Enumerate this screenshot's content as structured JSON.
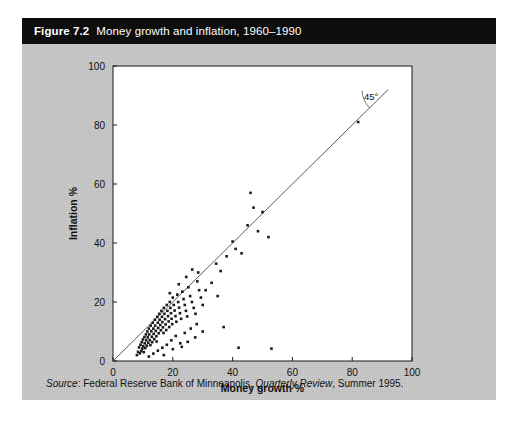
{
  "figure": {
    "number": "Figure 7.2",
    "title": "Money growth and inflation, 1960–1990",
    "source_label": "Source",
    "source_sep": ": ",
    "source_org": "Federal Reserve Bank of Minneapolis, ",
    "source_journal": "Quarterly Review",
    "source_tail": ", Summer 1995."
  },
  "colors": {
    "title_bar": "#0d0d0d",
    "title_text": "#ffffff",
    "panel": "#c9c9c9",
    "plot_bg": "#ffffff",
    "axis": "#1a1a1a",
    "point": "#1a1a1a",
    "line": "#4a4a4a",
    "page": "#ffffff"
  },
  "annotations": {
    "angle_label": "45°"
  },
  "chart_data": {
    "type": "scatter",
    "title": "Money growth and inflation, 1960–1990",
    "xlabel": "Money growth %",
    "ylabel": "Inflation %",
    "xlim": [
      0,
      100
    ],
    "ylim": [
      0,
      100
    ],
    "xticks": [
      0,
      20,
      40,
      60,
      80,
      100
    ],
    "yticks": [
      0,
      20,
      40,
      60,
      80,
      100
    ],
    "xticklabels": [
      "0",
      "20",
      "40",
      "60",
      "80",
      "100"
    ],
    "yticklabels": [
      "0",
      "20",
      "40",
      "60",
      "80",
      "100"
    ],
    "grid": false,
    "legend": false,
    "reference_line": {
      "label": "45°",
      "slope": 1,
      "intercept": 0,
      "from": [
        0,
        0
      ],
      "to": [
        92,
        92
      ]
    },
    "series": [
      {
        "name": "Countries",
        "marker": "square",
        "points": [
          [
            8.0,
            2.0
          ],
          [
            8.4,
            3.1
          ],
          [
            8.7,
            4.6
          ],
          [
            9.0,
            2.6
          ],
          [
            9.2,
            5.5
          ],
          [
            9.5,
            3.4
          ],
          [
            9.6,
            6.4
          ],
          [
            9.8,
            4.2
          ],
          [
            10.0,
            7.3
          ],
          [
            10.1,
            5.0
          ],
          [
            10.3,
            3.0
          ],
          [
            10.5,
            8.1
          ],
          [
            10.6,
            6.0
          ],
          [
            10.8,
            4.4
          ],
          [
            11.0,
            9.0
          ],
          [
            11.1,
            7.0
          ],
          [
            11.3,
            5.2
          ],
          [
            11.5,
            10.0
          ],
          [
            11.6,
            8.0
          ],
          [
            11.8,
            6.2
          ],
          [
            12.0,
            11.0
          ],
          [
            12.1,
            9.0
          ],
          [
            12.3,
            7.1
          ],
          [
            12.5,
            5.4
          ],
          [
            12.6,
            12.0
          ],
          [
            12.8,
            10.1
          ],
          [
            13.0,
            8.2
          ],
          [
            13.1,
            6.4
          ],
          [
            13.3,
            13.0
          ],
          [
            13.5,
            11.0
          ],
          [
            13.6,
            9.2
          ],
          [
            13.8,
            7.4
          ],
          [
            14.0,
            14.0
          ],
          [
            14.1,
            12.0
          ],
          [
            14.3,
            10.2
          ],
          [
            14.5,
            8.4
          ],
          [
            14.6,
            6.6
          ],
          [
            14.8,
            15.0
          ],
          [
            15.0,
            13.0
          ],
          [
            15.1,
            11.2
          ],
          [
            15.3,
            9.4
          ],
          [
            15.5,
            16.0
          ],
          [
            15.6,
            14.0
          ],
          [
            15.8,
            12.2
          ],
          [
            16.0,
            10.4
          ],
          [
            16.2,
            17.0
          ],
          [
            16.4,
            15.0
          ],
          [
            16.5,
            13.2
          ],
          [
            16.7,
            11.4
          ],
          [
            16.9,
            9.5
          ],
          [
            17.0,
            18.0
          ],
          [
            17.2,
            16.0
          ],
          [
            17.4,
            14.2
          ],
          [
            17.6,
            12.4
          ],
          [
            17.8,
            10.5
          ],
          [
            18.0,
            19.0
          ],
          [
            18.2,
            17.0
          ],
          [
            18.4,
            15.2
          ],
          [
            18.6,
            13.4
          ],
          [
            18.8,
            11.5
          ],
          [
            19.0,
            20.0
          ],
          [
            19.2,
            18.0
          ],
          [
            19.4,
            16.2
          ],
          [
            19.6,
            14.3
          ],
          [
            19.8,
            12.5
          ],
          [
            20.0,
            21.5
          ],
          [
            20.3,
            19.0
          ],
          [
            20.6,
            17.1
          ],
          [
            20.9,
            15.2
          ],
          [
            21.2,
            13.3
          ],
          [
            21.5,
            22.5
          ],
          [
            21.8,
            20.0
          ],
          [
            22.1,
            18.1
          ],
          [
            22.4,
            16.2
          ],
          [
            22.8,
            14.3
          ],
          [
            23.2,
            23.5
          ],
          [
            23.6,
            21.0
          ],
          [
            24.0,
            19.0
          ],
          [
            24.4,
            17.0
          ],
          [
            24.8,
            15.1
          ],
          [
            25.2,
            25.0
          ],
          [
            25.8,
            22.0
          ],
          [
            26.4,
            20.0
          ],
          [
            27.0,
            18.0
          ],
          [
            27.6,
            16.0
          ],
          [
            28.2,
            27.0
          ],
          [
            28.8,
            24.0
          ],
          [
            29.4,
            21.5
          ],
          [
            30.0,
            19.0
          ],
          [
            12.0,
            1.5
          ],
          [
            13.5,
            2.5
          ],
          [
            15.0,
            3.5
          ],
          [
            16.5,
            4.5
          ],
          [
            18.0,
            5.5
          ],
          [
            19.5,
            7.0
          ],
          [
            21.0,
            8.5
          ],
          [
            17.0,
            2.0
          ],
          [
            20.0,
            4.0
          ],
          [
            22.5,
            6.0
          ],
          [
            24.0,
            9.5
          ],
          [
            26.0,
            11.0
          ],
          [
            28.0,
            12.5
          ],
          [
            30.0,
            10.0
          ],
          [
            25.0,
            6.5
          ],
          [
            27.5,
            8.0
          ],
          [
            23.0,
            4.8
          ],
          [
            19.0,
            23.0
          ],
          [
            22.0,
            26.0
          ],
          [
            24.5,
            28.5
          ],
          [
            26.5,
            31.0
          ],
          [
            28.5,
            30.0
          ],
          [
            31.0,
            24.0
          ],
          [
            33.0,
            26.5
          ],
          [
            34.5,
            33.0
          ],
          [
            36.0,
            30.5
          ],
          [
            38.0,
            35.5
          ],
          [
            40.0,
            40.5
          ],
          [
            41.0,
            38.0
          ],
          [
            43.0,
            36.5
          ],
          [
            45.0,
            46.0
          ],
          [
            46.0,
            57.0
          ],
          [
            47.0,
            52.0
          ],
          [
            48.5,
            44.0
          ],
          [
            50.0,
            50.5
          ],
          [
            52.0,
            42.0
          ],
          [
            35.0,
            22.0
          ],
          [
            37.0,
            11.5
          ],
          [
            42.0,
            4.5
          ],
          [
            53.0,
            4.2
          ],
          [
            82.0,
            81.0
          ]
        ]
      }
    ]
  }
}
